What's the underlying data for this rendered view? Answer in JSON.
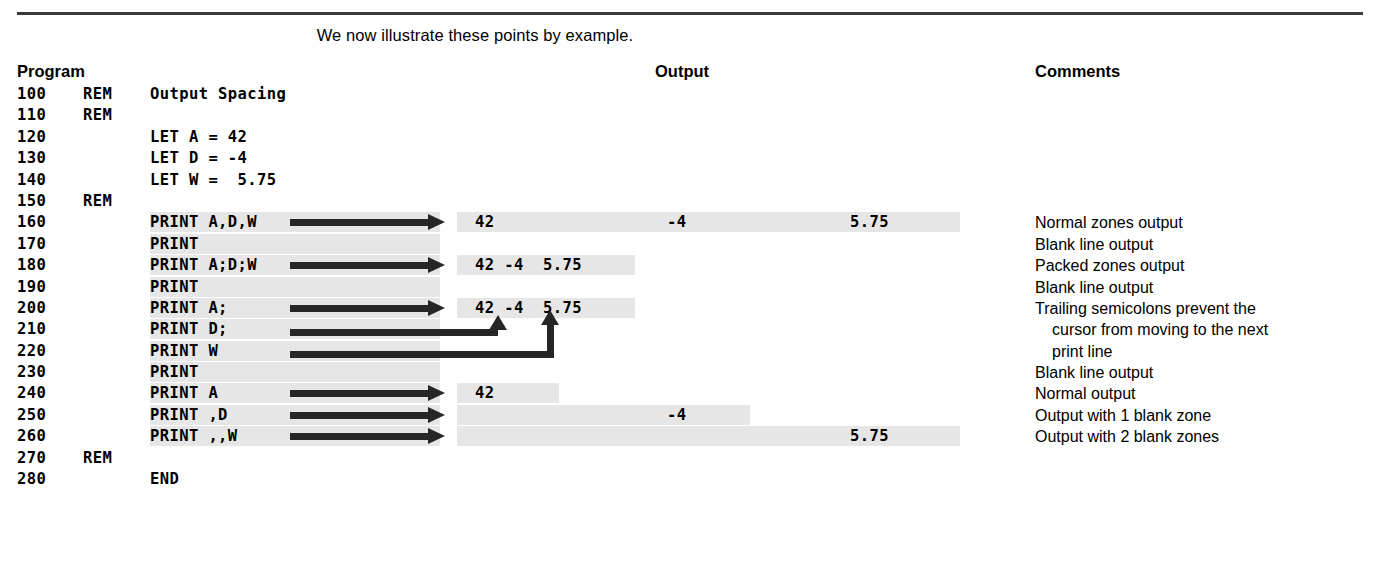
{
  "intro_text": "We now illustrate these points by example.",
  "headers": {
    "program": "Program",
    "output": "Output",
    "comments": "Comments"
  },
  "colors": {
    "highlight_band": "#e6e6e6",
    "arrow": "#262626",
    "rule": "#3a3a3a",
    "text": "#000000"
  },
  "rows": [
    {
      "lineno": "100",
      "kw": "REM",
      "stmt": "Output Spacing",
      "output": "",
      "comment": ""
    },
    {
      "lineno": "110",
      "kw": "REM",
      "stmt": "",
      "output": "",
      "comment": ""
    },
    {
      "lineno": "120",
      "kw": "",
      "stmt": "LET A = 42",
      "output": "",
      "comment": ""
    },
    {
      "lineno": "130",
      "kw": "",
      "stmt": "LET D = -4",
      "output": "",
      "comment": ""
    },
    {
      "lineno": "140",
      "kw": "",
      "stmt": "LET W =  5.75",
      "output": "",
      "comment": ""
    },
    {
      "lineno": "150",
      "kw": "REM",
      "stmt": "",
      "output": "",
      "comment": ""
    },
    {
      "lineno": "160",
      "kw": "",
      "stmt": "PRINT A,D,W",
      "output": "42",
      "output2": "-4",
      "output3": "5.75",
      "comment": "Normal zones output"
    },
    {
      "lineno": "170",
      "kw": "",
      "stmt": "PRINT",
      "output": "",
      "comment": "Blank line output"
    },
    {
      "lineno": "180",
      "kw": "",
      "stmt": "PRINT A;D;W",
      "output": "42 -4  5.75",
      "comment": "Packed zones output"
    },
    {
      "lineno": "190",
      "kw": "",
      "stmt": "PRINT",
      "output": "",
      "comment": "Blank line output"
    },
    {
      "lineno": "200",
      "kw": "",
      "stmt": "PRINT A;",
      "output": "42 -4  5.75",
      "comment": "Trailing semicolons prevent the"
    },
    {
      "lineno": "210",
      "kw": "",
      "stmt": "PRINT D;",
      "output": "",
      "comment": "cursor from moving to the next"
    },
    {
      "lineno": "220",
      "kw": "",
      "stmt": "PRINT W",
      "output": "",
      "comment": "print line"
    },
    {
      "lineno": "230",
      "kw": "",
      "stmt": "PRINT",
      "output": "",
      "comment": "Blank line output"
    },
    {
      "lineno": "240",
      "kw": "",
      "stmt": "PRINT A",
      "output": "42",
      "comment": "Normal output"
    },
    {
      "lineno": "250",
      "kw": "",
      "stmt": "PRINT ,D",
      "output": "-4",
      "comment": "Output with 1 blank zone"
    },
    {
      "lineno": "260",
      "kw": "",
      "stmt": "PRINT ,,W",
      "output": "5.75",
      "comment": "Output with 2 blank zones"
    },
    {
      "lineno": "270",
      "kw": "REM",
      "stmt": "",
      "output": "",
      "comment": ""
    },
    {
      "lineno": "280",
      "kw": "",
      "stmt": "END",
      "output": "",
      "comment": ""
    }
  ]
}
